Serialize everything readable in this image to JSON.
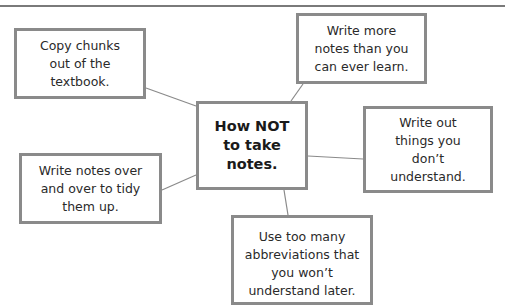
{
  "diagram": {
    "type": "mind-map",
    "center": {
      "label": "How NOT\nto take\nnotes."
    },
    "branches": [
      {
        "label": "Copy chunks\nout of the\ntextbook."
      },
      {
        "label": "Write more\nnotes than you\ncan ever learn."
      },
      {
        "label": "Write out\nthings you\ndon’t\nunderstand."
      },
      {
        "label": "Write notes over\nand over to tidy\nthem up."
      },
      {
        "label": "Use too many\nabbreviations that\nyou won’t\nunderstand later."
      }
    ]
  },
  "colors": {
    "border": "#8a8a8a",
    "connector": "#8a8a8a",
    "text": "#2a2a2a"
  }
}
